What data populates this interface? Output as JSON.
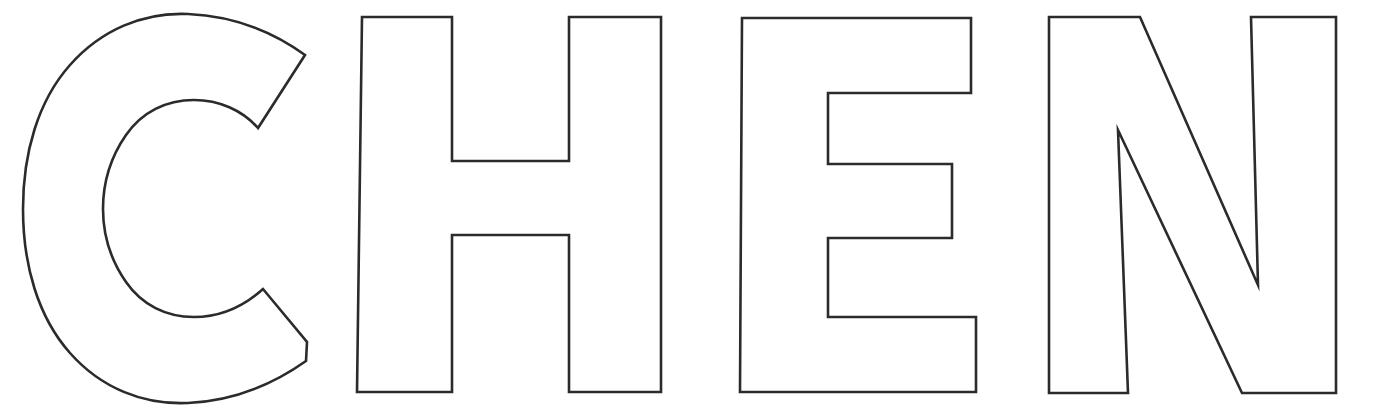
{
  "page": {
    "title": "CHEN",
    "word": "CHEN",
    "background_color": "#ffffff",
    "stroke_color": "#2b2b2b",
    "fill_color": "#ffffff",
    "canvas_width": 1396,
    "canvas_height": 417,
    "style": "bold sans-serif block capital letters, outline only, coloring-page style"
  },
  "letters": [
    {
      "id": "letter-c",
      "character": "C",
      "index": 1,
      "shape": "rounded-open-ring",
      "bbox": {
        "x": 23,
        "y": 13,
        "width": 288,
        "height": 390
      },
      "stroke_width": 2.6
    },
    {
      "id": "letter-h",
      "character": "H",
      "index": 2,
      "shape": "two-stems-with-crossbar",
      "bbox": {
        "x": 357,
        "y": 16,
        "width": 212,
        "height": 377
      },
      "stroke_width": 2.6
    },
    {
      "id": "letter-e",
      "character": "E",
      "index": 3,
      "shape": "stem-with-three-arms",
      "bbox": {
        "x": 740,
        "y": 16,
        "width": 237,
        "height": 377
      },
      "stroke_width": 2.6
    },
    {
      "id": "letter-n",
      "character": "N",
      "index": 4,
      "shape": "two-stems-with-diagonal",
      "bbox": {
        "x": 1049,
        "y": 16,
        "width": 288,
        "height": 378
      },
      "stroke_width": 2.6
    }
  ]
}
